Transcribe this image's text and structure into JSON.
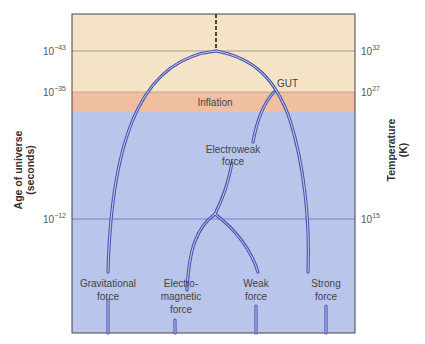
{
  "diagram": {
    "left_axis": {
      "title_line1": "Age of universe",
      "title_line2": "(seconds)",
      "ticks": [
        {
          "base": "10",
          "exp": "−43"
        },
        {
          "base": "10",
          "exp": "−35"
        },
        {
          "base": "10",
          "exp": "−12"
        }
      ]
    },
    "right_axis": {
      "title_line1": "Temperature",
      "title_line2": "(K)",
      "ticks": [
        {
          "base": "10",
          "exp": "32"
        },
        {
          "base": "10",
          "exp": "27"
        },
        {
          "base": "10",
          "exp": "15"
        }
      ]
    },
    "eras": [
      {
        "name": "Planck era",
        "color": "#f4e3c6"
      },
      {
        "name": "Inflation",
        "label": "Inflation",
        "color": "#f0bfa2"
      },
      {
        "name": "Later",
        "color": "#b9c5ea"
      }
    ],
    "labels": {
      "gut": "GUT",
      "inflation": "Inflation",
      "electroweak_line1": "Electroweak",
      "electroweak_line2": "force",
      "gravitational_line1": "Gravitational",
      "gravitational_line2": "force",
      "em_line1": "Electro-",
      "em_line2": "magnetic",
      "em_line3": "force",
      "weak_line1": "Weak",
      "weak_line2": "force",
      "strong_line1": "Strong",
      "strong_line2": "force"
    },
    "colors": {
      "branch_line": "#4a55b0",
      "branch_inner": "#c7cff0",
      "grid_line": "#6f7bbf",
      "frame": "#444444"
    }
  }
}
